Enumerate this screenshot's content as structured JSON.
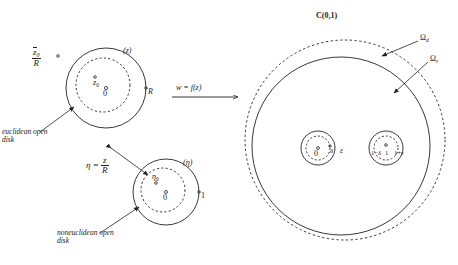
{
  "diagram": {
    "title_top_right": "C(0,1)",
    "map_arrow_label": "w = f(z)",
    "z_plane": {
      "plane_label": "(z)",
      "center_label": "0",
      "interior_point": "z",
      "interior_point_sub": "0",
      "radius_label": "R",
      "reflected_point_num_overline": "z",
      "reflected_point_num_sub": "0",
      "reflected_point_den": "R",
      "caption_line1": "euclidean  open",
      "caption_line2": "disk"
    },
    "eta_plane": {
      "plane_label": "(η)",
      "formula_lhs": "η =",
      "formula_num": "z",
      "formula_den": "R",
      "center_label": "0",
      "interior_point": "η",
      "interior_point_sub": "0",
      "radius_label": "1",
      "caption_line1": "noneuclidean  open",
      "caption_line2": "disk"
    },
    "w_plane": {
      "unit_circle_label": "C(0,1)",
      "omega_d": "Ω",
      "omega_d_sub": "d",
      "omega_e": "Ω",
      "omega_e_sub": "ε",
      "disk_zero": {
        "center_label": "0",
        "outer_label": "ε",
        "delta_mark": "δ"
      },
      "disk_one": {
        "center_label": "1",
        "left_label": "1−δ",
        "right_label": "1+ε"
      }
    }
  },
  "colors": {
    "ink": "#222222",
    "paper": "#ffffff"
  }
}
